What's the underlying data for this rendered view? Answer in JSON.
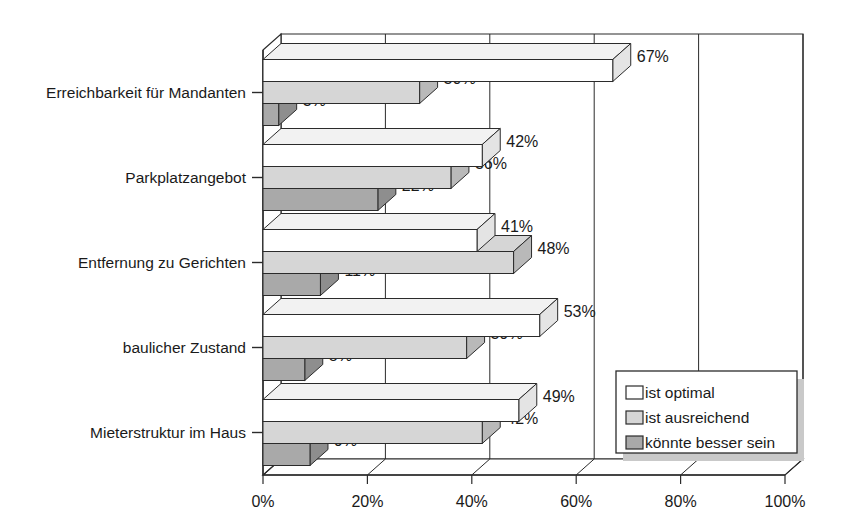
{
  "chart_data": {
    "type": "bar",
    "orientation": "horizontal",
    "grouped": true,
    "three_d": true,
    "title": "",
    "subtitle": "",
    "xlabel": "",
    "ylabel": "",
    "xlim": [
      0,
      100
    ],
    "xticks": [
      0,
      20,
      40,
      60,
      80,
      100
    ],
    "xtick_labels": [
      "0%",
      "20%",
      "40%",
      "60%",
      "80%",
      "100%"
    ],
    "grid": true,
    "grid_axis": "x",
    "legend_position": "lower-right-inside",
    "value_suffix": "%",
    "categories": [
      "Erreichbarkeit für Mandanten",
      "Parkplatzangebot",
      "Entfernung zu Gerichten",
      "baulicher Zustand",
      "Mieterstruktur im Haus"
    ],
    "series": [
      {
        "name": "ist optimal",
        "color": "#ffffff",
        "values": [
          67,
          42,
          41,
          53,
          49
        ],
        "labels": [
          "67%",
          "42%",
          "41%",
          "53%",
          "49%"
        ]
      },
      {
        "name": "ist ausreichend",
        "color": "#d6d6d6",
        "values": [
          30,
          36,
          48,
          39,
          42
        ],
        "labels": [
          "30%",
          "36%",
          "48%",
          "39%",
          "42%"
        ]
      },
      {
        "name": "könnte besser sein",
        "color": "#a9a9a9",
        "values": [
          3,
          22,
          11,
          8,
          9
        ],
        "labels": [
          "3%",
          "22%",
          "11%",
          "8%",
          "9%"
        ]
      }
    ]
  },
  "legend": {
    "items": [
      {
        "label": "ist optimal",
        "swatch": "#ffffff"
      },
      {
        "label": "ist ausreichend",
        "swatch": "#d6d6d6"
      },
      {
        "label": "könnte besser sein",
        "swatch": "#a9a9a9"
      }
    ]
  },
  "axis": {
    "x_tick_labels": [
      "0%",
      "20%",
      "40%",
      "60%",
      "80%",
      "100%"
    ],
    "y_tick_labels": [
      "Erreichbarkeit für Mandanten",
      "Parkplatzangebot",
      "Entfernung zu Gerichten",
      "baulicher Zustand",
      "Mieterstruktur im Haus"
    ]
  },
  "colors": {
    "series_optimal": "#ffffff",
    "series_sufficient": "#d6d6d6",
    "series_could_be_better": "#a9a9a9",
    "outline": "#2b2b2b",
    "background": "#ffffff",
    "shadow": "#c9c9c9"
  }
}
